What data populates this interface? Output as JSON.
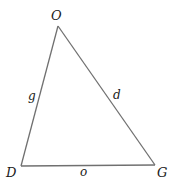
{
  "diagram": {
    "type": "triangle",
    "stroke_color": "#707070",
    "text_color": "#1a1a1a",
    "vertices": [
      {
        "name": "O",
        "x": 58,
        "y": 26
      },
      {
        "name": "D",
        "x": 21,
        "y": 166
      },
      {
        "name": "G",
        "x": 155,
        "y": 165
      }
    ],
    "vertex_labels": {
      "top": "O",
      "bottom_left": "D",
      "bottom_right": "G"
    },
    "side_labels": {
      "left": "g",
      "right": "d",
      "bottom": "o"
    },
    "sides": [
      {
        "from": "O",
        "to": "D",
        "label": "g"
      },
      {
        "from": "O",
        "to": "G",
        "label": "d"
      },
      {
        "from": "D",
        "to": "G",
        "label": "o"
      }
    ]
  }
}
